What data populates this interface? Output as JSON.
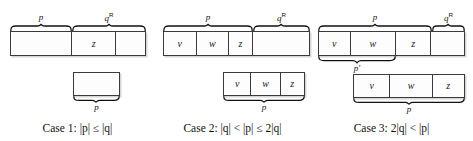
{
  "figure": {
    "cases": [
      {
        "id": "case-1",
        "caption": "Case 1: |p| ≤ |q|",
        "caption_parts": {
          "prefix": "Case 1:",
          "relation": "|p| ≤ |q|"
        },
        "top_box": {
          "cells": [
            {
              "label": "",
              "width": 62
            },
            {
              "label": "z",
              "width": 45
            },
            {
              "label": "",
              "width": 48
            }
          ]
        },
        "bottom_box": {
          "cells": [
            {
              "label": "",
              "width": 47
            }
          ]
        },
        "braces": [
          {
            "name": "p",
            "label": "p",
            "target": "top",
            "position": "above"
          },
          {
            "name": "qR",
            "label": "q",
            "superscript": "R",
            "target": "top",
            "position": "above"
          },
          {
            "name": "p-bottom",
            "label": "p",
            "target": "bottom",
            "position": "below"
          }
        ]
      },
      {
        "id": "case-2",
        "caption": "Case 2: |q| < |p| ≤ 2|q|",
        "caption_parts": {
          "prefix": "Case 2:",
          "relation": "|q| < |p| ≤ 2|q|"
        },
        "top_box": {
          "cells": [
            {
              "label": "v",
              "width": 33
            },
            {
              "label": "w",
              "width": 33
            },
            {
              "label": "z",
              "width": 24
            },
            {
              "label": "",
              "width": 57
            }
          ]
        },
        "bottom_box": {
          "cells": [
            {
              "label": "v",
              "width": 28
            },
            {
              "label": "w",
              "width": 30
            },
            {
              "label": "z",
              "width": 24
            }
          ]
        },
        "braces": [
          {
            "name": "p",
            "label": "p",
            "target": "top",
            "position": "above"
          },
          {
            "name": "qR",
            "label": "q",
            "superscript": "R",
            "target": "top",
            "position": "above"
          },
          {
            "name": "p-bottom",
            "label": "p",
            "target": "bottom",
            "position": "below"
          }
        ]
      },
      {
        "id": "case-3",
        "caption": "Case 3: 2|q| < |p|",
        "caption_parts": {
          "prefix": "Case 3:",
          "relation": "2|q| < |p|"
        },
        "top_box": {
          "cells": [
            {
              "label": "v",
              "width": 32
            },
            {
              "label": "w",
              "width": 46
            },
            {
              "label": "z",
              "width": 36
            },
            {
              "label": "",
              "width": 33
            }
          ]
        },
        "bottom_box": {
          "cells": [
            {
              "label": "v",
              "width": 37
            },
            {
              "label": "w",
              "width": 43
            },
            {
              "label": "z",
              "width": 32
            }
          ]
        },
        "braces": [
          {
            "name": "p",
            "label": "p",
            "target": "top",
            "position": "above"
          },
          {
            "name": "qR",
            "label": "q",
            "superscript": "R",
            "target": "top",
            "position": "above"
          },
          {
            "name": "p-prime",
            "label": "p",
            "prime": "′",
            "target": "top",
            "position": "below"
          },
          {
            "name": "p-bottom",
            "label": "p",
            "target": "bottom",
            "position": "below"
          }
        ]
      }
    ]
  },
  "style": {
    "box_border_color": "#3a3a3a",
    "box_fill_color": "#fdfdfd",
    "text_color": "#111111",
    "shadow_color": "#787878"
  }
}
